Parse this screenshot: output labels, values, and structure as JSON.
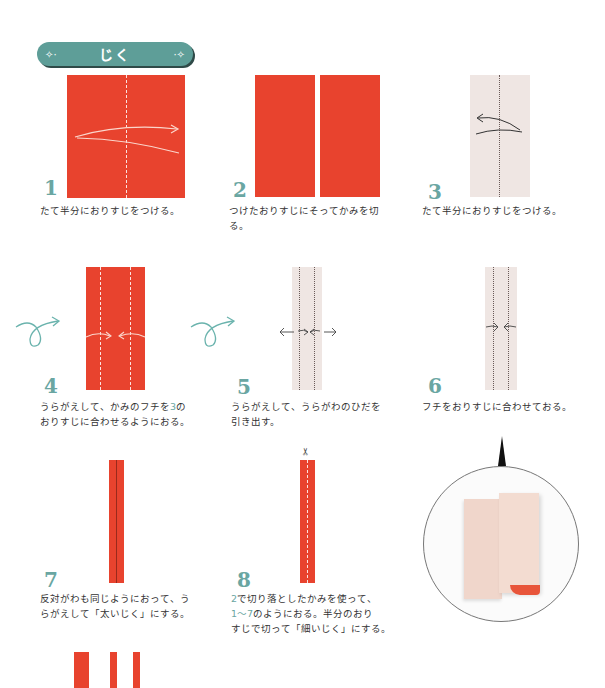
{
  "header": {
    "title": "じく",
    "left_ornament": "✧·",
    "right_ornament": "·✧",
    "color": "#5e9e98"
  },
  "colors": {
    "paper_red": "#e8432e",
    "paper_back": "#efe6e3",
    "step_number": "#6aa6a2",
    "flip_arrow": "#6ab3ad"
  },
  "steps": [
    {
      "number": "1",
      "caption": "たて半分におりすじをつける。"
    },
    {
      "number": "2",
      "caption": "つけたおりすじにそってかみを切\nる。"
    },
    {
      "number": "3",
      "caption": "たて半分におりすじをつける。"
    },
    {
      "number": "4",
      "caption_parts": [
        "うらがえして、かみのフチを",
        "3",
        "の\nおりすじに合わせるようにおる。"
      ]
    },
    {
      "number": "5",
      "caption": "うらがえして、うらがわのひだを\n引き出す。"
    },
    {
      "number": "6",
      "caption": "フチをおりすじに合わせておる。"
    },
    {
      "number": "7",
      "caption": "反対がわも同じようにおって、う\nらがえして「太いじく」にする。"
    },
    {
      "number": "8",
      "caption_parts": [
        "2",
        "で切り落としたかみを使って、\n",
        "1〜7",
        "のようにおる。半分のおり\nすじで切って「細いじく」にする。"
      ]
    }
  ],
  "icons": {
    "flip": "flip-over-arrow",
    "scissors": "✂"
  }
}
